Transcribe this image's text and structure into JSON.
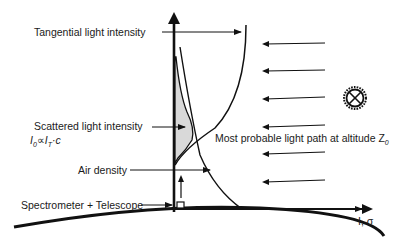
{
  "diagram": {
    "labels": {
      "tangential": "Tangential light intensity",
      "scattered": "Scattered light intensity",
      "scattered_formula": "I₀∝I_T·c",
      "air_density": "Air density",
      "instrument": "Spectrometer + Telescope",
      "light_path": "Most probable light path at altitude Z",
      "light_path_sub": "0",
      "x_axis": "I, σ"
    },
    "formula": {
      "I": "I",
      "sub0": "0",
      "prop": "∝",
      "IT": "I",
      "subT": "T",
      "dot_c": "·c"
    },
    "icons": {
      "sun": "sun-icon",
      "instrument": "telescope-box-icon"
    },
    "colors": {
      "line": "#111111",
      "fill": "#d9d9d9",
      "background": "#ffffff"
    }
  }
}
